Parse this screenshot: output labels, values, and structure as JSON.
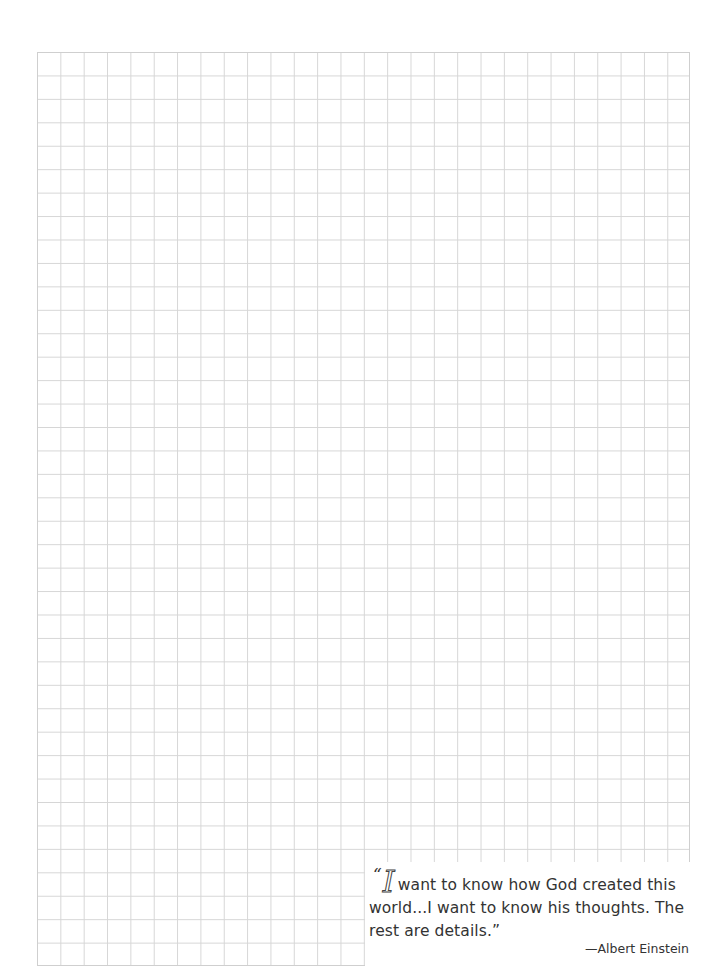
{
  "document": {
    "type": "graph-paper",
    "grid": {
      "columns": 28,
      "rows": 39,
      "line_color": "#d6d6d6",
      "border_color": "#cfcfcf"
    },
    "quote": {
      "open_mark": "“",
      "initial": "I",
      "line1_rest": "want to know how God created this",
      "line2": "world...I want to know his thoughts. The",
      "line3": "rest are details.”",
      "attribution": "—Albert Einstein",
      "text_color": "#333333"
    }
  }
}
